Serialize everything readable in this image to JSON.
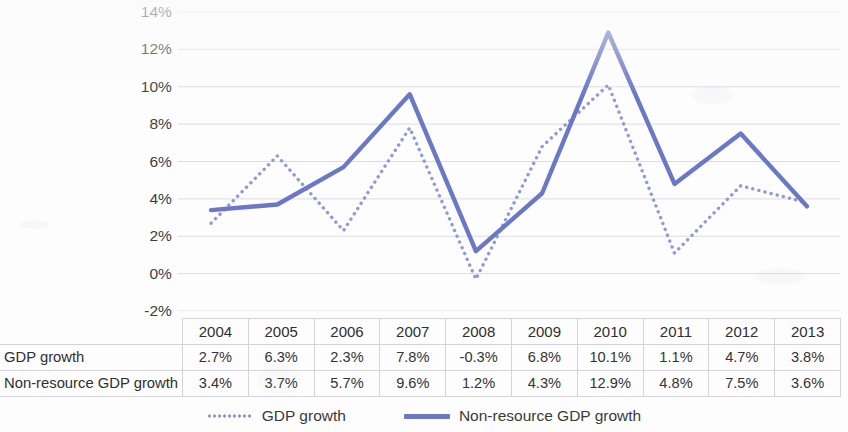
{
  "chart_data": {
    "type": "line",
    "title": "",
    "xlabel": "",
    "ylabel": "",
    "categories": [
      "2004",
      "2005",
      "2006",
      "2007",
      "2008",
      "2009",
      "2010",
      "2011",
      "2012",
      "2013"
    ],
    "series": [
      {
        "name": "GDP growth",
        "style": "dotted",
        "color": "#8f9ad6",
        "values": [
          2.7,
          6.3,
          2.3,
          7.8,
          -0.3,
          6.8,
          10.1,
          1.1,
          4.7,
          3.8
        ],
        "labels": [
          "2.7%",
          "6.3%",
          "2.3%",
          "7.8%",
          "-0.3%",
          "6.8%",
          "10.1%",
          "1.1%",
          "4.7%",
          "3.8%"
        ]
      },
      {
        "name": "Non-resource GDP growth",
        "style": "solid",
        "color": "#6b78c4",
        "values": [
          3.4,
          3.7,
          5.7,
          9.6,
          1.2,
          4.3,
          12.9,
          4.8,
          7.5,
          3.6
        ],
        "labels": [
          "3.4%",
          "3.7%",
          "5.7%",
          "9.6%",
          "1.2%",
          "4.3%",
          "12.9%",
          "4.8%",
          "7.5%",
          "3.6%"
        ]
      }
    ],
    "ylim": [
      -2,
      14
    ],
    "ytick_step": 2,
    "ytick_labels": [
      "14%",
      "12%",
      "10%",
      "8%",
      "6%",
      "4%",
      "2%",
      "0%",
      "-2%"
    ],
    "ytick_values": [
      14,
      12,
      10,
      8,
      6,
      4,
      2,
      0,
      -2
    ],
    "grid": true,
    "gridline_color": "#dcdce2",
    "legend_position": "bottom",
    "background_color": "#ffffff"
  },
  "table": {
    "corner_label": "",
    "column_headers": [
      "2004",
      "2005",
      "2006",
      "2007",
      "2008",
      "2009",
      "2010",
      "2011",
      "2012",
      "2013"
    ],
    "rows": [
      {
        "label": "GDP growth",
        "values": [
          "2.7%",
          "6.3%",
          "2.3%",
          "7.8%",
          "-0.3%",
          "6.8%",
          "10.1%",
          "1.1%",
          "4.7%",
          "3.8%"
        ]
      },
      {
        "label": "Non-resource GDP growth",
        "values": [
          "3.4%",
          "3.7%",
          "5.7%",
          "9.6%",
          "1.2%",
          "4.3%",
          "12.9%",
          "4.8%",
          "7.5%",
          "3.6%"
        ]
      }
    ]
  },
  "legend": {
    "entries": [
      {
        "label": "GDP growth",
        "style": "dotted",
        "color": "#8f9ad6"
      },
      {
        "label": "Non-resource GDP growth",
        "style": "solid",
        "color": "#6b78c4"
      }
    ]
  }
}
